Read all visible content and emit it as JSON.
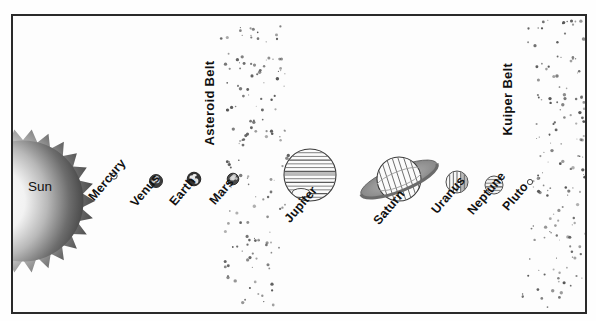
{
  "diagram": {
    "frame": {
      "border_color": "#2a2a2a",
      "background": "#fdfdfd"
    },
    "sun": {
      "name": "Sun",
      "label": "Sun",
      "cx": 10,
      "cy": 185,
      "radius": 72,
      "spikes": 26,
      "color_core": "#ffffff",
      "color_edge": "#4a4a4a"
    },
    "belts": [
      {
        "id": "asteroid-belt",
        "label": "Asteroid Belt",
        "label_x": 196,
        "label_y": 122,
        "label_rotation": -90,
        "band_x": 205,
        "band_width": 62,
        "dot_count": 150,
        "color": "#555555"
      },
      {
        "id": "kuiper-belt",
        "label": "Kuiper Belt",
        "label_x": 494,
        "label_y": 112,
        "label_rotation": -90,
        "band_x": 512,
        "band_width": 60,
        "dot_count": 160,
        "color": "#555555"
      }
    ],
    "planets": [
      {
        "name": "Mercury",
        "label": "Mercury",
        "cx": 101,
        "cy": 160,
        "radius": 3.2,
        "style": "tiny-circle",
        "fill": "#ffffff",
        "stroke": "#333333",
        "label_x": 78,
        "label_y": 176,
        "label_rotation": -50
      },
      {
        "name": "Venus",
        "label": "Venus",
        "cx": 143,
        "cy": 165,
        "radius": 6.5,
        "style": "mottled",
        "fill": "#3c3c3c",
        "stroke": "#222222",
        "label_x": 120,
        "label_y": 182,
        "label_rotation": -50
      },
      {
        "name": "Earth",
        "label": "Earth",
        "cx": 181,
        "cy": 163,
        "radius": 6.8,
        "style": "continents",
        "fill": "#333333",
        "stroke": "#1c1c1c",
        "label_x": 159,
        "label_y": 181,
        "label_rotation": -50
      },
      {
        "name": "Mars",
        "label": "Mars",
        "cx": 220,
        "cy": 163,
        "radius": 5.8,
        "style": "mottled",
        "fill": "#4a4a4a",
        "stroke": "#222222",
        "label_x": 199,
        "label_y": 180,
        "label_rotation": -50
      },
      {
        "name": "Jupiter",
        "label": "Jupiter",
        "cx": 297,
        "cy": 159,
        "radius": 26,
        "style": "banded-horizontal",
        "bands": 14,
        "fill": "#fbfbfb",
        "stroke": "#3a3a3a",
        "spot": {
          "cx": 288,
          "cy": 177,
          "rx": 9,
          "ry": 4.5
        },
        "label_x": 274,
        "label_y": 198,
        "label_rotation": -50
      },
      {
        "name": "Saturn",
        "label": "Saturn",
        "cx": 386,
        "cy": 163,
        "radius": 22,
        "style": "banded-diagonal",
        "bands": 8,
        "fill": "#fbfbfb",
        "stroke": "#3a3a3a",
        "ring": {
          "rx": 41,
          "ry": 12,
          "rotation": -22,
          "color": "#8a8a8a"
        },
        "label_x": 363,
        "label_y": 200,
        "label_rotation": -50
      },
      {
        "name": "Uranus",
        "label": "Uranus",
        "cx": 444,
        "cy": 166,
        "radius": 11,
        "style": "banded-vertical",
        "bands": 6,
        "fill": "#f7f7f7",
        "stroke": "#3a3a3a",
        "label_x": 421,
        "label_y": 189,
        "label_rotation": -50
      },
      {
        "name": "Neptune",
        "label": "Neptune",
        "cx": 481,
        "cy": 169,
        "radius": 9,
        "style": "banded-horizontal",
        "bands": 5,
        "fill": "#f2f2f2",
        "stroke": "#3a3a3a",
        "label_x": 457,
        "label_y": 190,
        "label_rotation": -50
      },
      {
        "name": "Pluto",
        "label": "Pluto",
        "cx": 517,
        "cy": 166,
        "radius": 2.6,
        "style": "tiny-circle",
        "fill": "#ffffff",
        "stroke": "#333333",
        "label_x": 492,
        "label_y": 186,
        "label_rotation": -50
      }
    ]
  }
}
